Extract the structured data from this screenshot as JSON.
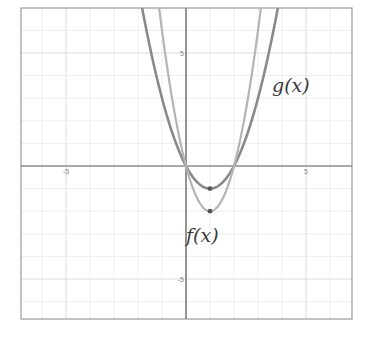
{
  "chart_data": {
    "type": "line",
    "title": "",
    "xlabel": "",
    "ylabel": "",
    "xlim": [
      -6.9,
      6.9
    ],
    "ylim": [
      -6.8,
      7
    ],
    "grid": true,
    "legend": "none",
    "x_ticks": [
      {
        "value": -5,
        "label": "-5"
      },
      {
        "value": 5,
        "label": "5"
      }
    ],
    "y_ticks": [
      {
        "value": 5,
        "label": "5"
      },
      {
        "value": -5,
        "label": "-5"
      }
    ],
    "series": [
      {
        "name": "g(x)",
        "expression": "x^2 - 2x",
        "color": "#8a8a8a",
        "width": 2.6,
        "vertex": [
          1,
          -1
        ],
        "roots": [
          0,
          2
        ]
      },
      {
        "name": "f(x)",
        "expression": "2x^2 - 4x",
        "color": "#b4b4b4",
        "width": 2.2,
        "vertex": [
          1,
          -2
        ],
        "roots": [
          0,
          2
        ]
      }
    ],
    "annotations": [
      {
        "text": "g(x)",
        "x": 4.3,
        "y": 3.4
      },
      {
        "text": "f(x)",
        "x": 0.0,
        "y": -3.2
      }
    ],
    "points": [
      {
        "series": "g(x)",
        "x": 1,
        "y": -1
      },
      {
        "series": "f(x)",
        "x": 1,
        "y": -2
      }
    ]
  },
  "labels": {
    "g": "g(x)",
    "f": "f(x)"
  }
}
